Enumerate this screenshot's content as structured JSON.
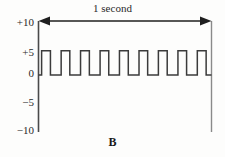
{
  "figure": {
    "panel_label": "B",
    "duration_label": "1 second",
    "background_color": "#fdfdfc",
    "line_color": "#3b3b3b",
    "text_color": "#2a2a2a"
  },
  "axis": {
    "tick_labels": [
      "+10",
      "+5",
      "0",
      "−5",
      "−10"
    ],
    "tick_values": [
      10,
      5,
      0,
      -5,
      -10
    ]
  },
  "chart_data": {
    "type": "line",
    "title": "",
    "subtitle": "",
    "xlabel": "1 second",
    "ylabel": "",
    "xlim": [
      0,
      1
    ],
    "ylim": [
      -10,
      10
    ],
    "yticks": [
      10,
      5,
      0,
      -5,
      -10
    ],
    "ytick_labels": [
      "+10",
      "+5",
      "0",
      "−5",
      "−10"
    ],
    "xticks": [],
    "xtick_labels": [],
    "grid": false,
    "legend": null,
    "annotations": [
      {
        "text": "1 second",
        "type": "span-arrow",
        "x_start": 0,
        "x_end": 1,
        "y": 10
      },
      {
        "text": "B",
        "type": "panel-label",
        "position": "bottom-center"
      }
    ],
    "series": [
      {
        "name": "square wave",
        "waveform": "square-pulse-train",
        "pulse_count": 9,
        "baseline": 0,
        "amplitude": 4.5,
        "period_seconds": 0.1125,
        "duty_cycle": 0.45,
        "lead_in_seconds": 0.018,
        "x": [
          0.0,
          0.018,
          0.018,
          0.069,
          0.069,
          0.131,
          0.131,
          0.181,
          0.181,
          0.243,
          0.243,
          0.294,
          0.294,
          0.356,
          0.356,
          0.406,
          0.406,
          0.468,
          0.468,
          0.519,
          0.519,
          0.581,
          0.581,
          0.631,
          0.631,
          0.693,
          0.693,
          0.744,
          0.744,
          0.806,
          0.806,
          0.856,
          0.856,
          0.918,
          0.918,
          0.969,
          0.969,
          1.0
        ],
        "y": [
          0,
          0,
          4.5,
          4.5,
          0,
          0,
          4.5,
          4.5,
          0,
          0,
          4.5,
          4.5,
          0,
          0,
          4.5,
          4.5,
          0,
          0,
          4.5,
          4.5,
          0,
          0,
          4.5,
          4.5,
          0,
          0,
          4.5,
          4.5,
          0,
          0,
          4.5,
          4.5,
          0,
          0,
          4.5,
          4.5,
          0,
          0
        ]
      }
    ]
  }
}
